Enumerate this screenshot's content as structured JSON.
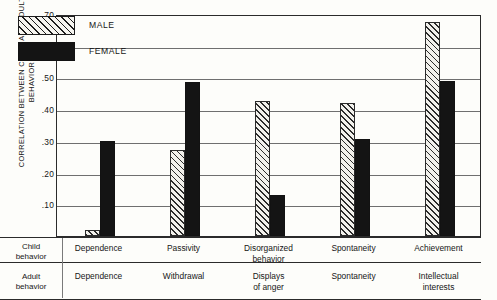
{
  "chart_data": {
    "type": "bar",
    "title": "",
    "xlabel": "",
    "ylabel": "CORRELATION BETWEEN CHILD AND ADULT BEHAVIOR",
    "ylim": [
      0.0,
      0.7
    ],
    "yticks": [
      0.1,
      0.2,
      0.3,
      0.4,
      0.5,
      0.6,
      0.7
    ],
    "ytick_labels": [
      ".10",
      ".20",
      ".30",
      ".40",
      ".50",
      ".60",
      ".70"
    ],
    "grid": true,
    "legend_position": "top-left",
    "categories": [
      "Dependence",
      "Passivity",
      "Disorganized behavior",
      "Spontaneity",
      "Achievement"
    ],
    "adult_categories": [
      "Dependence",
      "Withdrawal",
      "Displays of anger",
      "Spontaneity",
      "Intellectual interests"
    ],
    "series": [
      {
        "name": "MALE",
        "color": "#f2f1ec",
        "pattern": "diagonal-hatch",
        "values": [
          0.02,
          0.27,
          0.425,
          0.42,
          0.675
        ]
      },
      {
        "name": "FEMALE",
        "color": "#141414",
        "pattern": "solid",
        "values": [
          0.3,
          0.485,
          0.13,
          0.305,
          0.49
        ]
      }
    ]
  },
  "legend": {
    "items": [
      {
        "label": "MALE"
      },
      {
        "label": "FEMALE"
      }
    ]
  },
  "row_headers": {
    "child": "Child\nbehavior",
    "child_line1": "Child",
    "child_line2": "behavior",
    "adult_line1": "Adult",
    "adult_line2": "behavior"
  },
  "child_row": [
    {
      "line1": "Dependence",
      "line2": ""
    },
    {
      "line1": "Passivity",
      "line2": ""
    },
    {
      "line1": "Disorganized",
      "line2": "behavior"
    },
    {
      "line1": "Spontaneity",
      "line2": ""
    },
    {
      "line1": "Achievement",
      "line2": ""
    }
  ],
  "adult_row": [
    {
      "line1": "Dependence",
      "line2": ""
    },
    {
      "line1": "Withdrawal",
      "line2": ""
    },
    {
      "line1": "Displays",
      "line2": "of anger"
    },
    {
      "line1": "Spontaneity",
      "line2": ""
    },
    {
      "line1": "Intellectual",
      "line2": "interests"
    }
  ]
}
